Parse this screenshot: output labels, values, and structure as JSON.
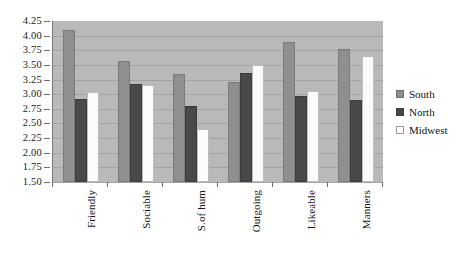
{
  "chart_data": {
    "type": "bar",
    "title": "",
    "subtitle": "",
    "xlabel": "",
    "ylabel": "",
    "ylim": [
      1.5,
      4.25
    ],
    "ytick_step": 0.25,
    "ytick_labels": [
      "4.25",
      "4.00",
      "3.75",
      "3.50",
      "3.25",
      "3.00",
      "2.75",
      "2.50",
      "2.25",
      "2.00",
      "1.75",
      "1.50"
    ],
    "grid": true,
    "legend_position": "right",
    "categories": [
      "Friendly",
      "Sociable",
      "S.of hum",
      "Outgoing",
      "Likeable",
      "Manners"
    ],
    "series": [
      {
        "name": "South",
        "color": "#8f8f8f",
        "values": [
          4.1,
          3.56,
          3.34,
          3.2,
          3.89,
          3.77
        ]
      },
      {
        "name": "North",
        "color": "#494949",
        "values": [
          2.92,
          3.17,
          2.8,
          3.37,
          2.97,
          2.9
        ]
      },
      {
        "name": "Midwest",
        "color": "#fbfbfb",
        "values": [
          3.03,
          3.15,
          2.4,
          3.5,
          3.05,
          3.65
        ]
      }
    ]
  },
  "legend": {
    "items": [
      {
        "label": "South",
        "swatch": "south-swatch"
      },
      {
        "label": "North",
        "swatch": "north-swatch"
      },
      {
        "label": "Midwest",
        "swatch": "midwest-swatch"
      }
    ]
  },
  "plot": {
    "background_color": "#b9b9b9",
    "gridline_color": "#a3a3a3",
    "axis_color": "#6a6a6a"
  }
}
